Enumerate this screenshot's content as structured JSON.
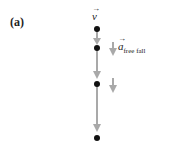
{
  "panel_label": "(a)",
  "velocity_label": "v",
  "accel_label": "a",
  "accel_subscript": "free fall",
  "colors": {
    "arrow": "#a9a9a9",
    "dot": "#111111"
  },
  "dots_y": [
    29,
    48,
    84,
    138
  ]
}
